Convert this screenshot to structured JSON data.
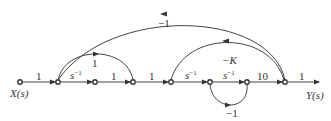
{
  "diagram": {
    "type": "signal-flow-graph",
    "input_label": "X(s)",
    "output_label": "Y(s)",
    "forward_branches": [
      {
        "from": "n1",
        "to": "n2",
        "gain": "1"
      },
      {
        "from": "n2",
        "to": "n3",
        "gain_base": "s",
        "gain_exp": "−1"
      },
      {
        "from": "n3",
        "to": "n4",
        "gain": "1"
      },
      {
        "from": "n4",
        "to": "n5",
        "gain": "1"
      },
      {
        "from": "n5",
        "to": "n6",
        "gain_base": "s",
        "gain_exp": "−1"
      },
      {
        "from": "n6",
        "to": "n7",
        "gain_base": "s",
        "gain_exp": "−1"
      },
      {
        "from": "n7",
        "to": "n8",
        "gain": "10"
      },
      {
        "from": "n8",
        "to": "out",
        "gain": "1"
      }
    ],
    "feedforward_branch": {
      "from": "n2",
      "to": "n4",
      "gain": "1"
    },
    "feedback_branches": [
      {
        "from": "n8",
        "to": "n2",
        "gain": "−1"
      },
      {
        "from": "n8",
        "to": "n5",
        "gain": "−K"
      },
      {
        "from": "n7",
        "to": "n6",
        "gain": "−1"
      }
    ]
  }
}
